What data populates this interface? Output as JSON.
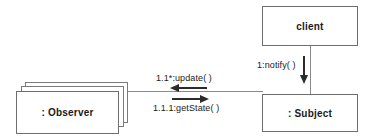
{
  "diagram": {
    "type": "uml-collaboration-diagram",
    "background_color": "#ffffff",
    "box_border_color": "#6e6e6e",
    "link_color": "#8a8a8a",
    "arrow_color": "#2b2b2b",
    "text_color": "#1a1a1a"
  },
  "nodes": {
    "client": {
      "label": "client",
      "kind": "object",
      "stacked": false
    },
    "subject": {
      "label": ": Subject",
      "kind": "object",
      "stacked": false
    },
    "observer": {
      "label": ": Observer",
      "kind": "multiobject",
      "stacked": true,
      "stack_count": 3
    }
  },
  "messages": [
    {
      "id": "notify",
      "label": "1:notify( )",
      "sequence": "1",
      "operation": "notify( )",
      "from": "client",
      "to": "subject",
      "direction": "down"
    },
    {
      "id": "update",
      "label": "1.1*:update( )",
      "sequence": "1.1*",
      "operation": "update( )",
      "from": "subject",
      "to": "observer",
      "direction": "left",
      "iterated": true
    },
    {
      "id": "getstate",
      "label": "1.1.1:getState( )",
      "sequence": "1.1.1",
      "operation": "getState( )",
      "from": "observer",
      "to": "subject",
      "direction": "right"
    }
  ],
  "links": [
    {
      "id": "observer-subject",
      "orientation": "horizontal"
    },
    {
      "id": "client-subject",
      "orientation": "vertical"
    }
  ]
}
